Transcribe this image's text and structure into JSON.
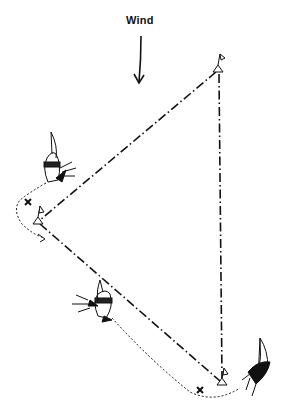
{
  "diagram": {
    "type": "sailing-race-course",
    "wind_label": "Wind",
    "wind_direction": "down",
    "marks": [
      {
        "name": "windward-mark",
        "x": 218,
        "y": 70
      },
      {
        "name": "wing-mark",
        "x": 38,
        "y": 222
      },
      {
        "name": "leeward-mark",
        "x": 222,
        "y": 383
      }
    ],
    "legs": [
      {
        "from": "windward-mark",
        "to": "wing-mark"
      },
      {
        "from": "wing-mark",
        "to": "leeward-mark"
      },
      {
        "from": "windward-mark",
        "to": "leeward-mark"
      }
    ],
    "boats": [
      {
        "name": "boat-approaching-wing-mark",
        "x": 55,
        "y": 170
      },
      {
        "name": "boat-on-reach",
        "x": 100,
        "y": 305
      },
      {
        "name": "boat-after-leeward-mark",
        "x": 262,
        "y": 368
      }
    ],
    "rounding_markers": [
      {
        "name": "wing-mark-x",
        "x": 28,
        "y": 202
      },
      {
        "name": "leeward-mark-x",
        "x": 200,
        "y": 390
      }
    ],
    "colors": {
      "ink": "#111111",
      "background": "#ffffff"
    }
  }
}
